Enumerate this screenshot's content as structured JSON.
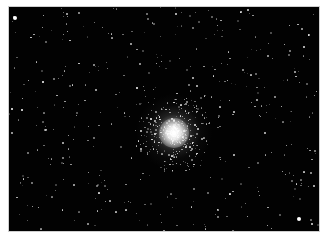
{
  "image": {
    "subject": "globular star cluster",
    "background_color": "#020202",
    "border_color": "#ffffff",
    "cluster_center": [
      165,
      126
    ],
    "bright_stars": [
      {
        "x": 6,
        "y": 11,
        "r": 2.2
      },
      {
        "x": 290,
        "y": 212,
        "r": 2.2
      },
      {
        "x": 34,
        "y": 75,
        "r": 1.4
      },
      {
        "x": 128,
        "y": 81,
        "r": 1.2
      },
      {
        "x": 13,
        "y": 103,
        "r": 1.1
      },
      {
        "x": 3,
        "y": 102,
        "r": 1.0
      }
    ]
  }
}
